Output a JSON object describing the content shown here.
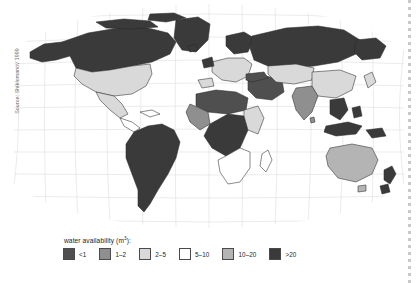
{
  "source_credit": "Source: Shiklomanov 1999",
  "legend": {
    "title_text": "water availability (m",
    "title_sup": "3",
    "title_tail": "):",
    "items": [
      {
        "label": "<1",
        "color": "#4f4f4f"
      },
      {
        "label": "1–2",
        "color": "#8f8f8f"
      },
      {
        "label": "2–5",
        "color": "#d9d9d9"
      },
      {
        "label": "5–10",
        "color": "#ffffff"
      },
      {
        "label": "10–20",
        "color": "#b4b4b4"
      },
      {
        "label": ">20",
        "color": "#3a3a3a"
      }
    ]
  },
  "map": {
    "projection": "robinson",
    "graticule_color": "#e2e2e2",
    "coast_color": "#2b2b2b",
    "ocean_color": "#ffffff",
    "regions": [
      {
        "name": "canada",
        "class": ">20"
      },
      {
        "name": "alaska",
        "class": ">20"
      },
      {
        "name": "greenland",
        "class": ">20"
      },
      {
        "name": "united-states",
        "class": "2–5"
      },
      {
        "name": "mexico",
        "class": "2–5"
      },
      {
        "name": "central-america",
        "class": "5–10"
      },
      {
        "name": "south-america",
        "class": ">20"
      },
      {
        "name": "north-africa",
        "class": "<1"
      },
      {
        "name": "west-africa",
        "class": "1–2"
      },
      {
        "name": "central-africa",
        "class": ">20"
      },
      {
        "name": "east-africa",
        "class": "2–5"
      },
      {
        "name": "southern-africa",
        "class": "5–10"
      },
      {
        "name": "madagascar",
        "class": "5–10"
      },
      {
        "name": "europe",
        "class": "2–5"
      },
      {
        "name": "scandinavia",
        "class": ">20"
      },
      {
        "name": "russia",
        "class": ">20"
      },
      {
        "name": "middle-east",
        "class": "<1"
      },
      {
        "name": "central-asia",
        "class": "2–5"
      },
      {
        "name": "india",
        "class": "1–2"
      },
      {
        "name": "china",
        "class": "2–5"
      },
      {
        "name": "southeast-asia",
        "class": ">20"
      },
      {
        "name": "indonesia",
        "class": ">20"
      },
      {
        "name": "japan",
        "class": "2–5"
      },
      {
        "name": "australia",
        "class": "10–20"
      },
      {
        "name": "new-zealand",
        "class": ">20"
      },
      {
        "name": "papua-new-guinea",
        "class": ">20"
      }
    ]
  }
}
